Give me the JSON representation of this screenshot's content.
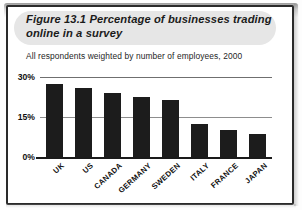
{
  "figure": {
    "number": "Figure 13.1",
    "title": "Percentage of businesses trading online in a survey",
    "subtitle": "All respondents weighted by number of employees, 2000"
  },
  "colors": {
    "bar": "#1c1c1c",
    "gridline": "#8d8d8d",
    "axis": "#1a1a1a",
    "title_band": "#e6e6e6",
    "page_border": "#2a2a2a",
    "text": "#101010"
  },
  "chart_data": {
    "type": "bar",
    "title": "Percentage of businesses trading online in a survey",
    "subtitle": "All respondents weighted by number of employees, 2000",
    "xlabel": "",
    "ylabel": "",
    "categories": [
      "UK",
      "US",
      "CANADA",
      "GERMANY",
      "SWEDEN",
      "ITALY",
      "FRANCE",
      "JAPAN"
    ],
    "values": [
      27.5,
      26,
      24,
      22.5,
      21.5,
      12.5,
      10,
      8.5
    ],
    "ylim": [
      0,
      30
    ],
    "yticks": [
      0,
      15,
      30
    ],
    "ytick_labels": [
      "0%",
      "15%",
      "30%"
    ],
    "grid": true,
    "legend": false
  }
}
